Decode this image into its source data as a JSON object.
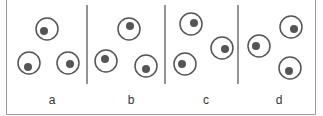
{
  "colors": {
    "stroke": "#555555",
    "dot": "#555555",
    "frame": "#9a9a9a",
    "divider": "#666666"
  },
  "panels": [
    {
      "label": "a",
      "label_x": 52,
      "circles": [
        {
          "cx": 47,
          "cy": 29,
          "dx": -3,
          "dy": 2
        },
        {
          "cx": 29,
          "cy": 63,
          "dx": -1,
          "dy": 4
        },
        {
          "cx": 68,
          "cy": 63,
          "dx": 2,
          "dy": 1
        }
      ]
    },
    {
      "label": "b",
      "label_x": 131,
      "circles": [
        {
          "cx": 129,
          "cy": 29,
          "dx": 1,
          "dy": -3
        },
        {
          "cx": 106,
          "cy": 61,
          "dx": -1,
          "dy": -2
        },
        {
          "cx": 146,
          "cy": 66,
          "dx": 0,
          "dy": 3
        }
      ]
    },
    {
      "label": "c",
      "label_x": 206,
      "circles": [
        {
          "cx": 191,
          "cy": 24,
          "dx": 3,
          "dy": -1
        },
        {
          "cx": 222,
          "cy": 48,
          "dx": 3,
          "dy": 1
        },
        {
          "cx": 185,
          "cy": 64,
          "dx": -3,
          "dy": 0
        }
      ]
    },
    {
      "label": "d",
      "label_x": 279,
      "circles": [
        {
          "cx": 259,
          "cy": 46,
          "dx": -3,
          "dy": 0
        },
        {
          "cx": 291,
          "cy": 27,
          "dx": 3,
          "dy": 2
        },
        {
          "cx": 290,
          "cy": 68,
          "dx": -1,
          "dy": 3
        }
      ]
    }
  ],
  "dividers_x": [
    87,
    165,
    238
  ],
  "circle_radius": 11,
  "dot_radius": 4
}
